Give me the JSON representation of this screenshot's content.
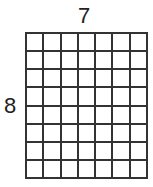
{
  "diagram": {
    "columns": 7,
    "rows": 8,
    "top_label": "7",
    "left_label": "8",
    "line_color": "#333333"
  }
}
